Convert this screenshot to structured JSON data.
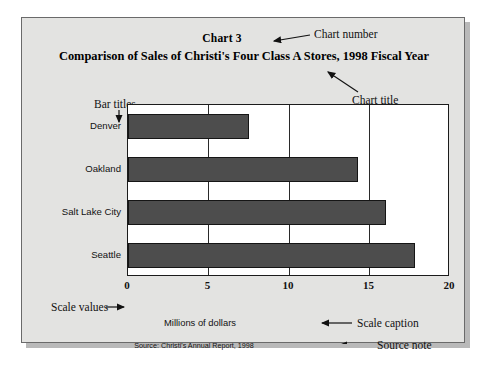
{
  "figure": {
    "chart_number": "Chart 3",
    "chart_title": "Comparison of Sales of Christi's Four Class A Stores, 1998 Fiscal Year",
    "axis_caption": "Millions of dollars",
    "source_note": "Source: Christi's Annual Report, 1998"
  },
  "annotations": {
    "chart_number": "Chart number",
    "chart_title": "Chart title",
    "bar_titles": "Bar titles",
    "scale_values": "Scale values",
    "scale_caption": "Scale caption",
    "source_note": "Source note"
  },
  "chart_data": {
    "type": "bar",
    "orientation": "horizontal",
    "title": "Comparison of Sales of Christi's Four Class A Stores, 1998 Fiscal Year",
    "subtitle": "Chart 3",
    "categories": [
      "Denver",
      "Oakland",
      "Salt Lake City",
      "Seattle"
    ],
    "values": [
      7.5,
      14.3,
      16.0,
      17.8
    ],
    "xlabel": "Millions of dollars",
    "ylabel": "",
    "xlim": [
      0,
      20
    ],
    "xticks": [
      0,
      5,
      10,
      15,
      20
    ],
    "xtick_labels": [
      "0",
      "5",
      "10",
      "15",
      "20"
    ],
    "grid": "vertical",
    "legend": "none",
    "bar_color": "#4d4d4d",
    "bar_edge_color": "#151515",
    "plot_background": "#ffffff",
    "page_background": "#e3e3e1",
    "source": "Source: Christi's Annual Report, 1998"
  }
}
